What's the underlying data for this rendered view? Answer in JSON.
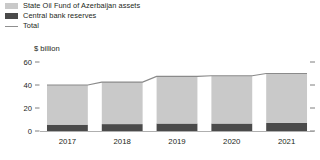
{
  "legend": {
    "items": [
      {
        "key": "fund",
        "label": "State Oil Fund of Azerbaijan assets",
        "color": "#c9c9c9",
        "marker": "square-swatch-icon"
      },
      {
        "key": "reserve",
        "label": "Central bank reserves",
        "color": "#4a4a4a",
        "marker": "square-swatch-icon"
      },
      {
        "key": "total",
        "label": "Total",
        "color": "#8f8f8f",
        "marker": "line-swatch-icon"
      }
    ]
  },
  "chart_data": {
    "type": "bar",
    "title": "",
    "subtitle": "",
    "unit_label": "$ billion",
    "xlabel": "",
    "ylabel": "$ billion",
    "categories": [
      "2017",
      "2018",
      "2019",
      "2020",
      "2021"
    ],
    "series": [
      {
        "name": "Central bank reserves",
        "values": [
          5.5,
          6.0,
          6.5,
          6.5,
          7.0
        ],
        "color": "#4a4a4a",
        "stack": "assets"
      },
      {
        "name": "State Oil Fund of Azerbaijan assets",
        "values": [
          34.5,
          36.5,
          41.0,
          41.5,
          43.0
        ],
        "color": "#c9c9c9",
        "stack": "assets"
      }
    ],
    "overlay": {
      "name": "Total",
      "type": "line",
      "values": [
        40.0,
        42.5,
        47.5,
        48.0,
        50.0
      ],
      "color": "#8a8a8a"
    },
    "ylim": [
      0,
      60
    ],
    "yticks": [
      0,
      20,
      40,
      60
    ],
    "ytick_labels": [
      "0",
      "20",
      "40",
      "60"
    ],
    "grid": false,
    "legend_position": "top-left",
    "right_axis_ticks": true,
    "stacked": true
  }
}
